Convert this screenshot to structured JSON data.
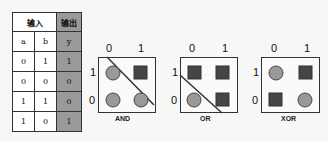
{
  "table": {
    "header_input": "输入",
    "header_output": "输出",
    "columns": [
      "a",
      "b",
      "y"
    ],
    "rows": [
      [
        "0",
        "1",
        "1"
      ],
      [
        "0",
        "0",
        "0"
      ],
      [
        "1",
        "1",
        "0"
      ],
      [
        "1",
        "0",
        "1"
      ]
    ]
  },
  "kmaps": [
    {
      "name": "AND",
      "col_labels": [
        "0",
        "1"
      ],
      "row_labels": [
        "1",
        "0"
      ],
      "cells": [
        [
          "circle",
          "square"
        ],
        [
          "circle",
          "circle"
        ]
      ],
      "divider": "diag-down"
    },
    {
      "name": "OR",
      "col_labels": [
        "0",
        "1"
      ],
      "row_labels": [
        "1",
        "0"
      ],
      "cells": [
        [
          "square",
          "square"
        ],
        [
          "circle",
          "square"
        ]
      ],
      "divider": "diag-down"
    },
    {
      "name": "XOR",
      "col_labels": [
        "0",
        "1"
      ],
      "row_labels": [
        "1",
        "0"
      ],
      "cells": [
        [
          "circle",
          "square"
        ],
        [
          "square",
          "circle"
        ]
      ],
      "divider": "none"
    }
  ],
  "colors": {
    "circle_fill": "#999999",
    "square_fill": "#454545",
    "output_col": "#999999",
    "stroke": "#333333"
  }
}
